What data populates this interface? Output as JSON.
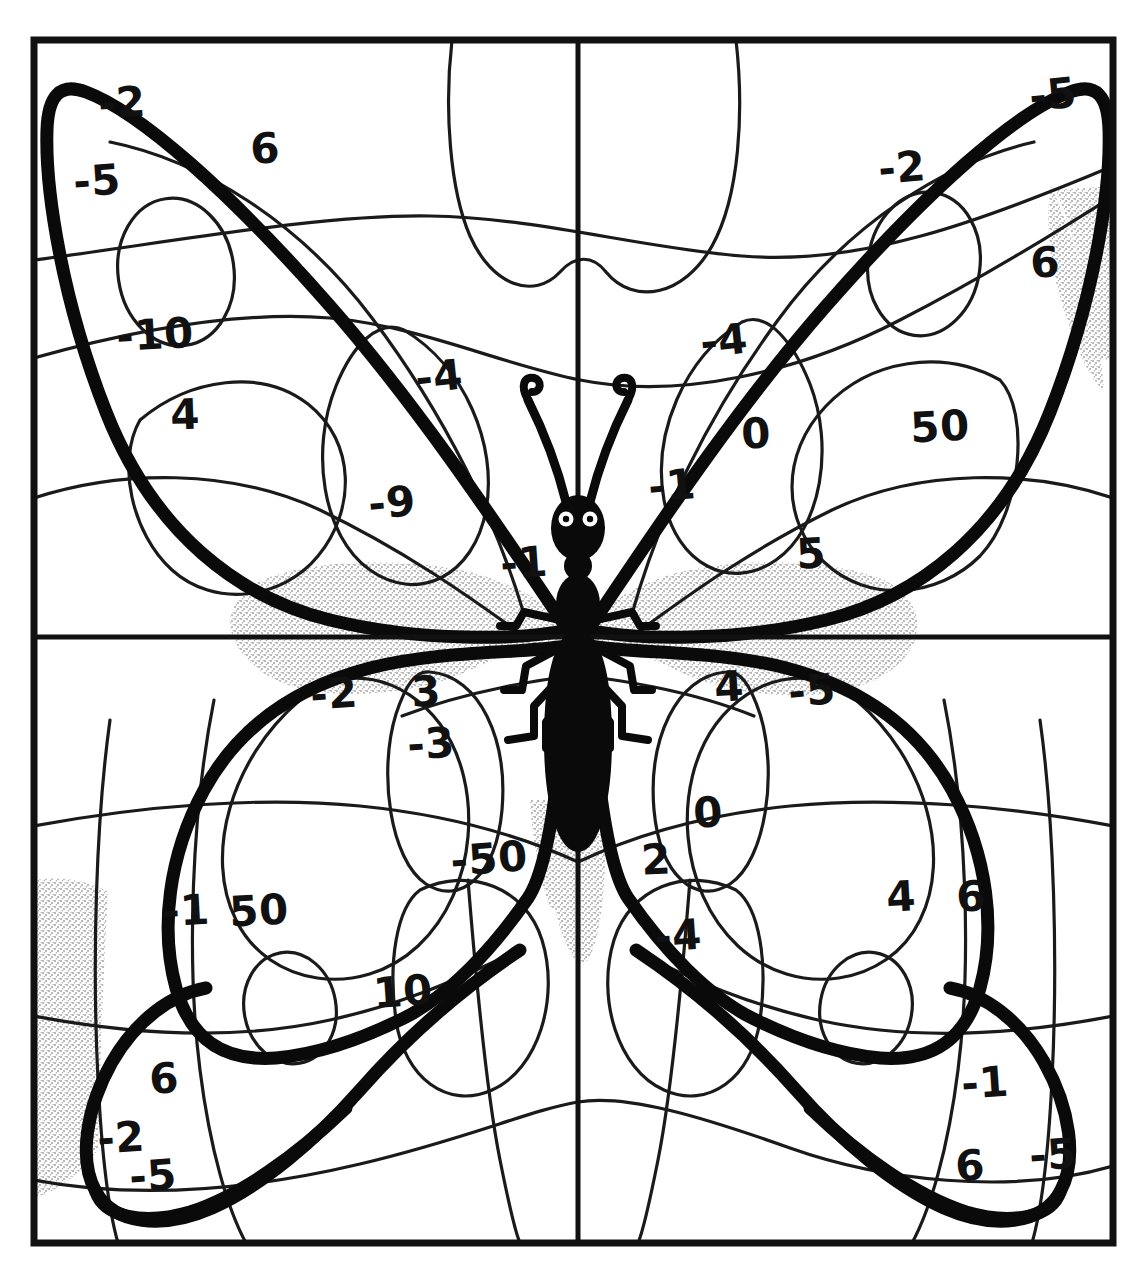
{
  "worksheet": {
    "title": "Butterfly color-by-number worksheet",
    "description": "Hand-drawn black and white butterfly line art divided into numbered regions for a color-by-number integer activity.",
    "cropped_header_text": "",
    "frame": {
      "stroke_color": "#111111",
      "background_color": "#ffffff",
      "left": 34,
      "top": 40,
      "right": 1113,
      "bottom": 1243
    },
    "axes": {
      "vertical_x": 578,
      "horizontal_y": 637,
      "note": "Two thin straight lines divide the drawing into four quadrants."
    },
    "stipple_color": "#cfcfcf"
  },
  "numbers": [
    {
      "id": "n01",
      "value": "-2",
      "x": 122,
      "y": 103,
      "size": 42,
      "rot": -4,
      "quadrant": "top-left"
    },
    {
      "id": "n02",
      "value": "6",
      "x": 265,
      "y": 149,
      "size": 42,
      "rot": -3,
      "quadrant": "top-left"
    },
    {
      "id": "n03",
      "value": "-5",
      "x": 97,
      "y": 181,
      "size": 42,
      "rot": -4,
      "quadrant": "top-left"
    },
    {
      "id": "n04",
      "value": "-10",
      "x": 155,
      "y": 335,
      "size": 42,
      "rot": -3,
      "quadrant": "top-left"
    },
    {
      "id": "n05",
      "value": "4",
      "x": 185,
      "y": 415,
      "size": 42,
      "rot": -2,
      "quadrant": "top-left"
    },
    {
      "id": "n06",
      "value": "-4",
      "x": 439,
      "y": 377,
      "size": 42,
      "rot": -6,
      "quadrant": "top-left"
    },
    {
      "id": "n07",
      "value": "-9",
      "x": 392,
      "y": 503,
      "size": 42,
      "rot": -5,
      "quadrant": "top-left"
    },
    {
      "id": "n08",
      "value": "-1",
      "x": 524,
      "y": 563,
      "size": 42,
      "rot": -4,
      "quadrant": "top-left"
    },
    {
      "id": "n09",
      "value": "-5",
      "x": 1053,
      "y": 95,
      "size": 42,
      "rot": -6,
      "quadrant": "top-right"
    },
    {
      "id": "n10",
      "value": "-2",
      "x": 902,
      "y": 168,
      "size": 42,
      "rot": -5,
      "quadrant": "top-right"
    },
    {
      "id": "n11",
      "value": "6",
      "x": 1045,
      "y": 263,
      "size": 42,
      "rot": -3,
      "quadrant": "top-right"
    },
    {
      "id": "n12",
      "value": "-4",
      "x": 724,
      "y": 341,
      "size": 42,
      "rot": -6,
      "quadrant": "top-right"
    },
    {
      "id": "n13",
      "value": "0",
      "x": 756,
      "y": 434,
      "size": 42,
      "rot": -3,
      "quadrant": "top-right"
    },
    {
      "id": "n14",
      "value": "50",
      "x": 940,
      "y": 427,
      "size": 42,
      "rot": -3,
      "quadrant": "top-right"
    },
    {
      "id": "n15",
      "value": "-1",
      "x": 672,
      "y": 486,
      "size": 42,
      "rot": -5,
      "quadrant": "top-right"
    },
    {
      "id": "n16",
      "value": "5",
      "x": 811,
      "y": 554,
      "size": 42,
      "rot": -3,
      "quadrant": "top-right"
    },
    {
      "id": "n17",
      "value": "-2",
      "x": 334,
      "y": 694,
      "size": 42,
      "rot": -4,
      "quadrant": "bottom-left"
    },
    {
      "id": "n18",
      "value": "3",
      "x": 426,
      "y": 692,
      "size": 42,
      "rot": -3,
      "quadrant": "bottom-left"
    },
    {
      "id": "n19",
      "value": "-3",
      "x": 431,
      "y": 744,
      "size": 42,
      "rot": -4,
      "quadrant": "bottom-left"
    },
    {
      "id": "n20",
      "value": "-50",
      "x": 489,
      "y": 859,
      "size": 42,
      "rot": -4,
      "quadrant": "bottom-left"
    },
    {
      "id": "n21",
      "value": "-1",
      "x": 186,
      "y": 911,
      "size": 42,
      "rot": -3,
      "quadrant": "bottom-left"
    },
    {
      "id": "n22",
      "value": "50",
      "x": 259,
      "y": 911,
      "size": 42,
      "rot": -3,
      "quadrant": "bottom-left"
    },
    {
      "id": "n23",
      "value": "10",
      "x": 403,
      "y": 992,
      "size": 42,
      "rot": -4,
      "quadrant": "bottom-left"
    },
    {
      "id": "n24",
      "value": "6",
      "x": 164,
      "y": 1079,
      "size": 42,
      "rot": -3,
      "quadrant": "bottom-left"
    },
    {
      "id": "n25",
      "value": "-2",
      "x": 121,
      "y": 1138,
      "size": 42,
      "rot": -4,
      "quadrant": "bottom-left"
    },
    {
      "id": "n26",
      "value": "-5",
      "x": 153,
      "y": 1176,
      "size": 42,
      "rot": -4,
      "quadrant": "bottom-left"
    },
    {
      "id": "n27",
      "value": "4",
      "x": 729,
      "y": 687,
      "size": 42,
      "rot": -3,
      "quadrant": "bottom-right"
    },
    {
      "id": "n28",
      "value": "-5",
      "x": 812,
      "y": 691,
      "size": 42,
      "rot": -5,
      "quadrant": "bottom-right"
    },
    {
      "id": "n29",
      "value": "0",
      "x": 708,
      "y": 813,
      "size": 42,
      "rot": -3,
      "quadrant": "bottom-right"
    },
    {
      "id": "n30",
      "value": "2",
      "x": 656,
      "y": 860,
      "size": 42,
      "rot": -3,
      "quadrant": "bottom-right"
    },
    {
      "id": "n31",
      "value": "4",
      "x": 901,
      "y": 897,
      "size": 42,
      "rot": -3,
      "quadrant": "bottom-right"
    },
    {
      "id": "n32",
      "value": "6",
      "x": 971,
      "y": 897,
      "size": 42,
      "rot": -3,
      "quadrant": "bottom-right"
    },
    {
      "id": "n33",
      "value": "-4",
      "x": 678,
      "y": 936,
      "size": 42,
      "rot": -4,
      "quadrant": "bottom-right"
    },
    {
      "id": "n34",
      "value": "-1",
      "x": 985,
      "y": 1083,
      "size": 42,
      "rot": -4,
      "quadrant": "bottom-right"
    },
    {
      "id": "n35",
      "value": "6",
      "x": 970,
      "y": 1166,
      "size": 42,
      "rot": -3,
      "quadrant": "bottom-right"
    },
    {
      "id": "n36",
      "value": "-5",
      "x": 1053,
      "y": 1155,
      "size": 42,
      "rot": -4,
      "quadrant": "bottom-right"
    }
  ]
}
